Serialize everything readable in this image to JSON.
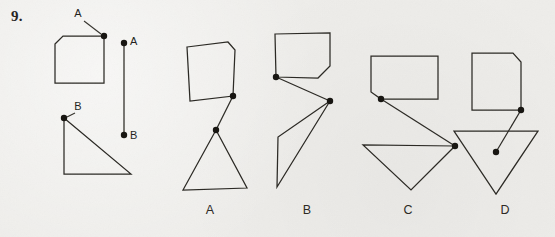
{
  "question": {
    "number": "9.",
    "type": "spatial-rotation-multiple-choice"
  },
  "colors": {
    "background": "#eeedea",
    "ink": "#2a2823",
    "dot": "#161410",
    "label": "#231f1c"
  },
  "point_labels": {
    "a": "A",
    "b": "B"
  },
  "prompt": {
    "pentagon": {
      "name": "chamfered-rectangle",
      "points": "55,44 63,36 104,36 104,83 55,83",
      "marked_vertex": {
        "label": "A",
        "x": 104,
        "y": 36
      },
      "label_pos": {
        "x": 78,
        "y": 17
      },
      "leader": {
        "x1": 84,
        "y1": 21,
        "x2": 101,
        "y2": 34
      }
    },
    "triangle": {
      "name": "right-triangle",
      "points": "64,118 131,174 64,174",
      "marked_vertex": {
        "label": "B",
        "x": 64,
        "y": 118
      },
      "label_pos": {
        "x": 78,
        "y": 110
      },
      "leader": {
        "x1": 75,
        "y1": 113,
        "x2": 67,
        "y2": 117
      }
    },
    "connector": {
      "name": "join-segment",
      "x1": 124,
      "y1": 43,
      "x2": 124,
      "y2": 135,
      "endpoint_a": {
        "label": "A",
        "x": 124,
        "y": 43,
        "label_x": 130,
        "label_y": 45
      },
      "endpoint_b": {
        "label": "B",
        "x": 124,
        "y": 135,
        "label_x": 130,
        "label_y": 139
      }
    }
  },
  "options": [
    {
      "id": "A",
      "label": "A",
      "label_pos": {
        "x": 210,
        "y": 214
      },
      "pentagon": "187,47 228,42 235,50 233,96 190,101",
      "pentagon_point": {
        "x": 233,
        "y": 96
      },
      "triangle": "216,130 247,188 183,190",
      "triangle_point": {
        "x": 216,
        "y": 130
      },
      "connector": {
        "x1": 233,
        "y1": 96,
        "x2": 216,
        "y2": 130
      }
    },
    {
      "id": "B",
      "label": "B",
      "label_pos": {
        "x": 307,
        "y": 214
      },
      "pentagon": "275,34 330,33 330,66 318,78 276,77",
      "pentagon_point": {
        "x": 276,
        "y": 77
      },
      "triangle": "330,101 277,187 278,137",
      "triangle_point": {
        "x": 330,
        "y": 101
      },
      "connector": {
        "x1": 276,
        "y1": 77,
        "x2": 330,
        "y2": 101
      }
    },
    {
      "id": "C",
      "label": "C",
      "label_pos": {
        "x": 408,
        "y": 214
      },
      "pentagon": "371,56 438,56 438,99 381,99 371,92",
      "pentagon_point": {
        "x": 381,
        "y": 99
      },
      "triangle": "455,146 363,145 411,190",
      "triangle_point": {
        "x": 455,
        "y": 146
      },
      "connector": {
        "x1": 381,
        "y1": 99,
        "x2": 455,
        "y2": 146
      }
    },
    {
      "id": "D",
      "label": "D",
      "label_pos": {
        "x": 505,
        "y": 214
      },
      "pentagon": "472,53 513,53 521,62 521,110 472,110",
      "pentagon_point": {
        "x": 521,
        "y": 110
      },
      "triangle": "454,131 538,131 496,194",
      "triangle_point": {
        "x": 496,
        "y": 152
      },
      "connector": {
        "x1": 521,
        "y1": 110,
        "x2": 496,
        "y2": 152
      }
    }
  ]
}
